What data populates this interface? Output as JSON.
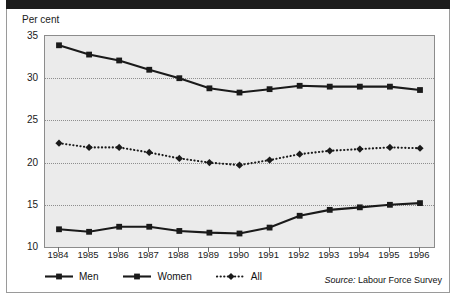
{
  "figure": {
    "banner_title": "",
    "unit_label": "Per cent",
    "source_label": "Source:",
    "source_text": "Labour Force Survey"
  },
  "legend": {
    "position": "bottom-left",
    "items": [
      {
        "label": "Men",
        "color": "#1a1a1a",
        "marker": "square",
        "line": "solid"
      },
      {
        "label": "Women",
        "color": "#1a1a1a",
        "marker": "square",
        "line": "solid"
      },
      {
        "label": "All",
        "color": "#1a1a1a",
        "marker": "diamond",
        "line": "dotted"
      }
    ]
  },
  "chart_data": {
    "type": "line",
    "title": "",
    "xlabel": "",
    "ylabel": "Per cent",
    "ylim": [
      10,
      35
    ],
    "yticks": [
      10,
      15,
      20,
      25,
      30,
      35
    ],
    "grid": true,
    "categories": [
      "1984",
      "1985",
      "1986",
      "1987",
      "1988",
      "1989",
      "1990",
      "1991",
      "1992",
      "1993",
      "1994",
      "1995",
      "1996"
    ],
    "series": [
      {
        "name": "Men",
        "marker": "square",
        "line": "solid",
        "color": "#1a1a1a",
        "values": [
          33.9,
          32.8,
          32.1,
          31.0,
          30.0,
          28.8,
          28.3,
          28.7,
          29.1,
          29.0,
          29.0,
          29.0,
          28.6
        ]
      },
      {
        "name": "Women",
        "marker": "square",
        "line": "solid",
        "color": "#1a1a1a",
        "values": [
          12.1,
          11.8,
          12.4,
          12.4,
          11.9,
          11.7,
          11.6,
          12.3,
          13.7,
          14.4,
          14.7,
          15.0,
          15.2
        ]
      },
      {
        "name": "All",
        "marker": "diamond",
        "line": "dotted",
        "color": "#1a1a1a",
        "values": [
          22.3,
          21.8,
          21.8,
          21.2,
          20.5,
          20.0,
          19.7,
          20.3,
          21.0,
          21.4,
          21.6,
          21.8,
          21.7
        ]
      }
    ]
  }
}
